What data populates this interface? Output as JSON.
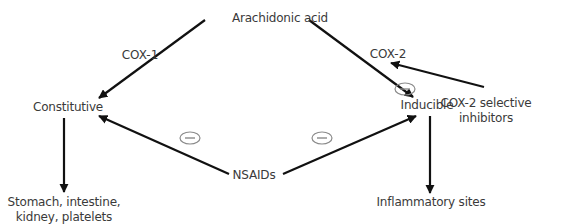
{
  "diagram": {
    "nodes": {
      "arachidonic_acid": "Arachidonic acid",
      "constitutive": "Constitutive",
      "inducible": "Inducible",
      "nsaids": "NSAIDs",
      "cox2_inhibitors_line1": "COX-2 selective",
      "cox2_inhibitors_line2": "inhibitors",
      "stomach_line1": "Stomach, intestine,",
      "stomach_line2": "kidney, platelets",
      "inflammatory_sites": "Inflammatory sites"
    },
    "edge_labels": {
      "cox1": "COX-1",
      "cox2": "COX-2"
    },
    "inhibition_symbol": "minus-in-ellipse",
    "edges": [
      {
        "from": "Arachidonic acid",
        "to": "Constitutive",
        "label": "COX-1"
      },
      {
        "from": "Arachidonic acid",
        "to": "Inducible",
        "label": "COX-2"
      },
      {
        "from": "COX-2 selective inhibitors",
        "to": "COX-2",
        "inhibits": true
      },
      {
        "from": "NSAIDs",
        "to": "Constitutive",
        "inhibits": true
      },
      {
        "from": "NSAIDs",
        "to": "Inducible",
        "inhibits": true
      },
      {
        "from": "Constitutive",
        "to": "Stomach, intestine, kidney, platelets"
      },
      {
        "from": "Inducible",
        "to": "Inflammatory sites"
      }
    ],
    "colors": {
      "arrow": "#111111",
      "text": "#3a3a3a",
      "inhibit_ellipse": "#8a8a8a"
    }
  }
}
